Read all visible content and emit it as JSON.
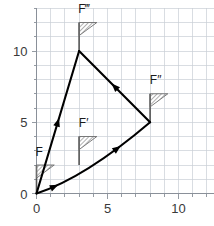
{
  "figure": {
    "title": "",
    "background_color": "#ffffff",
    "grid_color": "#c9cfd6",
    "axis_color": "#8a9099",
    "vector_color": "#000000",
    "flag_pole_color": "#555555",
    "flag_hatch_color": "#6e6e6e"
  },
  "axes": {
    "x": {
      "label": "",
      "min": 0,
      "max": 12.5,
      "ticks": [
        0,
        5,
        10
      ],
      "tick_labels": [
        "0",
        "5",
        "10"
      ],
      "minor_step": 1
    },
    "y": {
      "label": "",
      "min": 0,
      "max": 13,
      "ticks": [
        0,
        5,
        10
      ],
      "tick_labels": [
        "0",
        "5",
        "10"
      ],
      "minor_step": 1
    },
    "grid": "on"
  },
  "chart_data": {
    "type": "scatter",
    "title": "",
    "xlabel": "",
    "ylabel": "",
    "xlim": [
      0,
      12.5
    ],
    "ylim": [
      0,
      13
    ],
    "grid": true,
    "legend": "none",
    "flags": [
      {
        "label": "F",
        "x": 0,
        "y": 0,
        "pole_height": 2,
        "label_dx": -0.35,
        "label_dy": 2.9
      },
      {
        "label": "F′",
        "x": 3,
        "y": 2,
        "pole_height": 2,
        "label_dx": -0.3,
        "label_dy": 4.95
      },
      {
        "label": "F″",
        "x": 8,
        "y": 5,
        "pole_height": 2,
        "label_dx": -0.3,
        "label_dy": 7.95
      },
      {
        "label": "F‴",
        "x": 3,
        "y": 10,
        "pole_height": 2,
        "label_dx": -0.35,
        "label_dy": 12.95
      }
    ],
    "vectors": [
      {
        "name": "origin-to-F3",
        "from": [
          0,
          0
        ],
        "to": [
          3,
          10
        ],
        "curved": false,
        "arrow_at": 0.5,
        "arrow_direction": "up"
      },
      {
        "name": "F2-to-F3",
        "from": [
          8,
          5
        ],
        "to": [
          3,
          10
        ],
        "curved": false,
        "arrow_at": 0.5,
        "arrow_direction": "up-left"
      },
      {
        "name": "origin-to-F2",
        "from": [
          0,
          0
        ],
        "to": [
          8,
          5
        ],
        "curved": true,
        "control": [
          3.4,
          1.1
        ],
        "arrows_at": [
          0.18,
          0.74
        ],
        "arrow_direction": "up-right"
      }
    ]
  },
  "tick_label_text": {
    "x0": "0",
    "x5": "5",
    "x10": "10",
    "y0": "0",
    "y5": "5",
    "y10": "10"
  }
}
